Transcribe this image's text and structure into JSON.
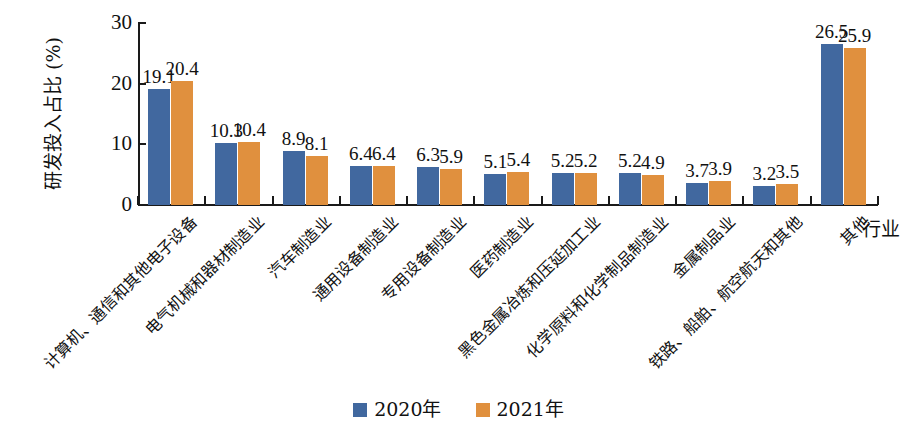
{
  "chart_data": {
    "type": "bar",
    "title": "",
    "xlabel": "行业",
    "ylabel": "研发投入占比 (%)",
    "ylim": [
      0,
      30
    ],
    "yticks": [
      0,
      10,
      20,
      30
    ],
    "grid": false,
    "legend_position": "bottom-center",
    "categories": [
      "计算机、通信和其他电子设备",
      "电气机械和器材制造业",
      "汽车制造业",
      "通用设备制造业",
      "专用设备制造业",
      "医药制造业",
      "黑色金属冶炼和压延加工业",
      "化学原料和化学制品制造业",
      "金属制品业",
      "铁路、船舶、航空航天和其他",
      "其他"
    ],
    "series": [
      {
        "name": "2020年",
        "color": "#41689f",
        "values": [
          19.1,
          10.3,
          8.9,
          6.4,
          6.3,
          5.1,
          5.2,
          5.2,
          3.7,
          3.2,
          26.5
        ],
        "labels": [
          "19.1",
          "10.3",
          "8.9",
          "6.4",
          "6.3",
          "5.1",
          "5.2",
          "5.2",
          "3.7",
          "3.2",
          "26.5"
        ]
      },
      {
        "name": "2021年",
        "color": "#e0903e",
        "values": [
          20.4,
          10.4,
          8.1,
          6.4,
          5.9,
          5.4,
          5.2,
          4.9,
          3.9,
          3.5,
          25.9
        ],
        "labels": [
          "20.4",
          "10.4",
          "8.1",
          "6.4",
          "5.9",
          "5.4",
          "5.2",
          "4.9",
          "3.9",
          "3.5",
          "25.9"
        ]
      }
    ]
  },
  "legend": {
    "items": [
      {
        "label": "2020年",
        "color": "#41689f"
      },
      {
        "label": "2021年",
        "color": "#e0903e"
      }
    ]
  },
  "axis": {
    "y_title": "研发投入占比 (%)",
    "x_title": "行业",
    "y_tick_labels": [
      "0",
      "10",
      "20",
      "30"
    ]
  }
}
